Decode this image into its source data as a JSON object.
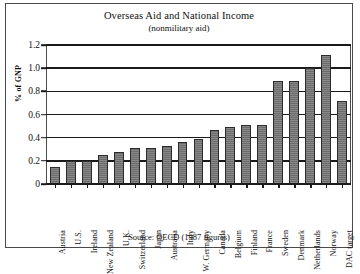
{
  "figure": {
    "title": "Overseas Aid and National Income",
    "subtitle": "(nonmilitary aid)",
    "source_note": "Source: OECD (1987 figures)",
    "ylabel": "% of GNP",
    "frame_color": "#4a4a4a",
    "bar_color": "#787878",
    "bar_edge_color": "#2b2b2b",
    "axis_color": "#1a1a1a"
  },
  "chart_data": {
    "type": "bar",
    "title": "Overseas Aid and National Income",
    "subtitle": "(nonmilitary aid)",
    "xlabel": "",
    "ylabel": "% of GNP",
    "ylim": [
      0,
      1.2
    ],
    "ytick_labels": [
      "1.2",
      "1.0",
      "0.8",
      "0.6",
      "0.4",
      "0.2",
      "0"
    ],
    "ytick_values": [
      1.2,
      1.0,
      0.8,
      0.6,
      0.4,
      0.2,
      0
    ],
    "grid": true,
    "legend": false,
    "annotation": "Source: OECD (1987 figures)",
    "categories": [
      "Austria",
      "U.S.",
      "Ireland",
      "New Zealand",
      "U.K.",
      "Switzerland",
      "Japan",
      "Australia",
      "Italy",
      "W. Germany",
      "Canada",
      "Belgium",
      "Finland",
      "France",
      "Sweden",
      "Denmark",
      "Netherlands",
      "Norway",
      "DAC target"
    ],
    "values": [
      0.15,
      0.2,
      0.2,
      0.25,
      0.28,
      0.31,
      0.31,
      0.33,
      0.36,
      0.39,
      0.47,
      0.49,
      0.51,
      0.51,
      0.89,
      0.89,
      1.0,
      1.11,
      0.72
    ]
  }
}
